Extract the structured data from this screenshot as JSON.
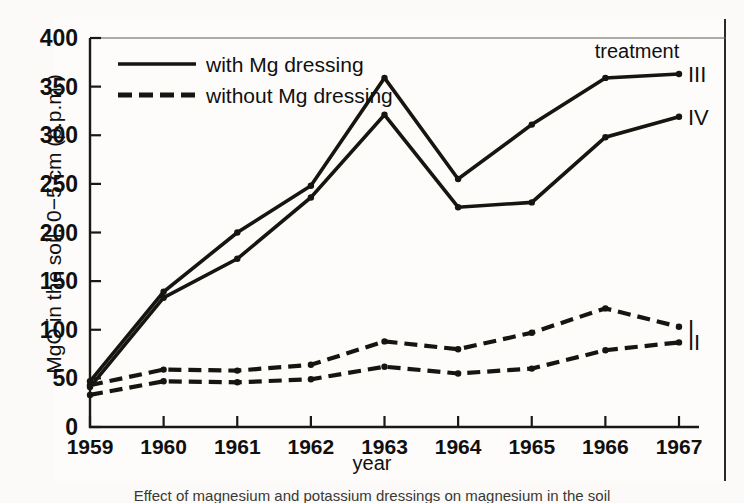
{
  "chart_data": {
    "type": "line",
    "title": "",
    "xlabel": "year",
    "ylabel": "MgO in the soil, 0−5 cm (p.p.m.)",
    "categories": [
      "1959",
      "1960",
      "1961",
      "1962",
      "1963",
      "1964",
      "1965",
      "1966",
      "1967"
    ],
    "x": [
      1959,
      1960,
      1961,
      1962,
      1963,
      1964,
      1965,
      1966,
      1967
    ],
    "xlim": [
      1959,
      1967
    ],
    "ylim": [
      0,
      400
    ],
    "yticks": [
      "0",
      "50",
      "100",
      "150",
      "200",
      "250",
      "300",
      "350",
      "400"
    ],
    "ytick_values": [
      0,
      50,
      100,
      150,
      200,
      250,
      300,
      350,
      400
    ],
    "grid": false,
    "legend_position": "top-left",
    "series": [
      {
        "name": "III",
        "label": "III",
        "style": "solid",
        "group": "with Mg dressing",
        "values": [
          47,
          139,
          200,
          248,
          359,
          255,
          311,
          359,
          363
        ]
      },
      {
        "name": "IV",
        "label": "IV",
        "style": "solid",
        "group": "with Mg dressing",
        "values": [
          41,
          133,
          173,
          236,
          321,
          226,
          231,
          298,
          319
        ]
      },
      {
        "name": "I",
        "label": "I",
        "style": "dashed",
        "group": "without Mg dressing",
        "values": [
          43,
          59,
          58,
          64,
          88,
          80,
          97,
          122,
          103
        ]
      },
      {
        "name": "II",
        "label": "II",
        "style": "dashed",
        "group": "without Mg dressing",
        "values": [
          33,
          47,
          46,
          49,
          62,
          55,
          60,
          79,
          87
        ]
      }
    ]
  },
  "legend": {
    "entries": [
      {
        "label": "with Mg dressing",
        "style": "solid"
      },
      {
        "label": "without Mg dressing",
        "style": "dashed"
      }
    ]
  },
  "annotations": {
    "treatment_header": "treatment"
  },
  "caption": {
    "text": "Effect of magnesium and potassium dressings on magnesium in the soil"
  },
  "colors": {
    "ink": "#17150f",
    "paper": "#fdfcfa"
  }
}
